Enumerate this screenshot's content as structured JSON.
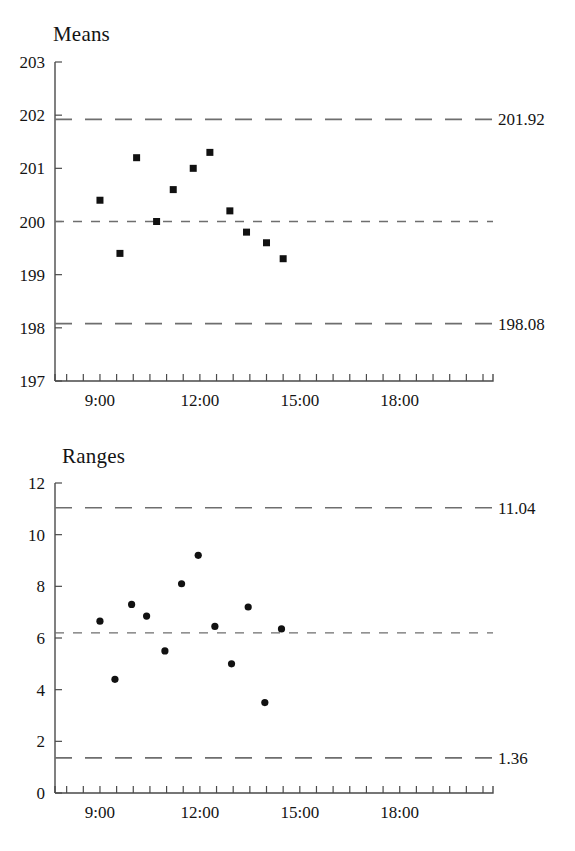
{
  "chart_data": [
    {
      "type": "scatter",
      "title": "Means",
      "xlabel": "",
      "ylabel": "",
      "grid": false,
      "legend": null,
      "marker": "square",
      "xlim": [
        7.65,
        20.8
      ],
      "ylim": [
        197,
        203
      ],
      "yticks": [
        197,
        198,
        199,
        200,
        201,
        202,
        203
      ],
      "ytick_labels": [
        "197",
        "198",
        "199",
        "200",
        "201",
        "202",
        "203"
      ],
      "xticks": [
        9,
        12,
        15,
        18
      ],
      "xtick_labels": [
        "9:00",
        "12:00",
        "15:00",
        "18:00"
      ],
      "xtick_minor_step": 0.5,
      "reference_lines": [
        {
          "name": "upper-control-limit",
          "value": 201.92,
          "label": "201.92",
          "style": "dashed-long"
        },
        {
          "name": "center-line",
          "value": 200.0,
          "label": "",
          "style": "dashed-short"
        },
        {
          "name": "lower-control-limit",
          "value": 198.08,
          "label": "198.08",
          "style": "dashed-long"
        }
      ],
      "x": [
        9.0,
        9.6,
        10.1,
        10.7,
        11.2,
        11.8,
        12.3,
        12.9,
        13.4,
        14.0,
        14.5
      ],
      "values": [
        200.4,
        199.4,
        201.2,
        200.0,
        200.6,
        201.0,
        201.3,
        200.2,
        199.8,
        199.6,
        199.3
      ],
      "x_labels": [
        "9:00",
        "9:36",
        "10:06",
        "10:42",
        "11:12",
        "11:48",
        "12:18",
        "12:54",
        "13:24",
        "14:00",
        "14:30"
      ]
    },
    {
      "type": "scatter",
      "title": "Ranges",
      "xlabel": "",
      "ylabel": "",
      "grid": false,
      "legend": null,
      "marker": "circle",
      "xlim": [
        7.65,
        20.8
      ],
      "ylim": [
        0,
        12
      ],
      "yticks": [
        0,
        2,
        4,
        6,
        8,
        10,
        12
      ],
      "ytick_labels": [
        "0",
        "2",
        "4",
        "6",
        "8",
        "10",
        "12"
      ],
      "xticks": [
        9,
        12,
        15,
        18
      ],
      "xtick_labels": [
        "9:00",
        "12:00",
        "15:00",
        "18:00"
      ],
      "xtick_minor_step": 0.5,
      "reference_lines": [
        {
          "name": "upper-control-limit",
          "value": 11.04,
          "label": "11.04",
          "style": "dashed-long"
        },
        {
          "name": "center-line",
          "value": 6.2,
          "label": "",
          "style": "dashed-short"
        },
        {
          "name": "lower-control-limit",
          "value": 1.36,
          "label": "1.36",
          "style": "dashed-long"
        }
      ],
      "x": [
        9.0,
        9.45,
        9.95,
        10.4,
        10.95,
        11.45,
        11.95,
        12.45,
        12.95,
        13.45,
        13.95,
        14.45
      ],
      "values": [
        6.65,
        4.4,
        7.3,
        6.85,
        5.5,
        8.1,
        9.2,
        6.45,
        5.0,
        7.2,
        3.5,
        6.35
      ],
      "x_labels": [
        "9:00",
        "9:27",
        "9:57",
        "10:24",
        "10:57",
        "11:27",
        "11:57",
        "12:27",
        "12:57",
        "13:27",
        "13:57",
        "14:27"
      ]
    }
  ],
  "style": {
    "marker_color": "#111111",
    "limit_line_color": "#6e6e6e",
    "axis_color": "#4a4a4a",
    "text_color": "#141414",
    "background": "#ffffff"
  }
}
